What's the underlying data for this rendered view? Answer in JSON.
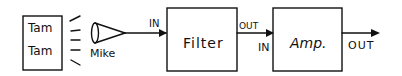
{
  "diagram": {
    "source_box": {
      "line1": "Tam",
      "line2": "Tam"
    },
    "mic": {
      "label": "Mike"
    },
    "filter": {
      "label": "Filter",
      "in_label": "IN",
      "out_label": "OUT"
    },
    "amp": {
      "label": "Amp.",
      "in_label": "IN",
      "out_label": "OUT"
    },
    "colors": {
      "stroke": "#111111",
      "background": "#ffffff"
    }
  }
}
